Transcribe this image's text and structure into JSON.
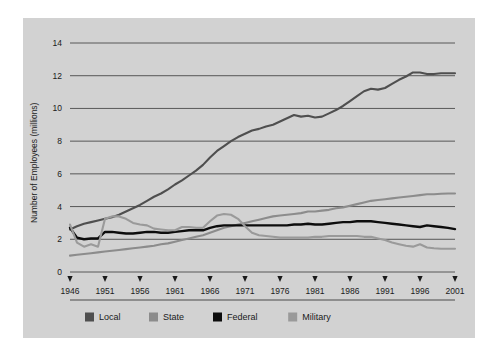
{
  "figure": {
    "background_color": "#d2d2d2",
    "page_background": "#ffffff"
  },
  "chart_data": {
    "type": "line",
    "title": "",
    "xlabel": "",
    "ylabel": "Number of Employees (millions)",
    "xlim": [
      1946,
      2001
    ],
    "ylim": [
      0,
      14
    ],
    "grid": "horizontal",
    "legend_position": "bottom",
    "xticks": [
      "1946",
      "1951",
      "1956",
      "1961",
      "1966",
      "1971",
      "1976",
      "1981",
      "1986",
      "1991",
      "1996",
      "2001"
    ],
    "yticks": [
      "0",
      "2",
      "4",
      "6",
      "8",
      "10",
      "12",
      "14"
    ],
    "x": [
      1946,
      1947,
      1948,
      1949,
      1950,
      1951,
      1952,
      1953,
      1954,
      1955,
      1956,
      1957,
      1958,
      1959,
      1960,
      1961,
      1962,
      1963,
      1964,
      1965,
      1966,
      1967,
      1968,
      1969,
      1970,
      1971,
      1972,
      1973,
      1974,
      1975,
      1976,
      1977,
      1978,
      1979,
      1980,
      1981,
      1982,
      1983,
      1984,
      1985,
      1986,
      1987,
      1988,
      1989,
      1990,
      1991,
      1992,
      1993,
      1994,
      1995,
      1996,
      1997,
      1998,
      1999,
      2000,
      2001
    ],
    "series": [
      {
        "name": "Local",
        "color": "#4f4f4f",
        "width": 2.1,
        "values": [
          2.6,
          2.8,
          2.95,
          3.05,
          3.15,
          3.25,
          3.35,
          3.5,
          3.7,
          3.9,
          4.1,
          4.35,
          4.6,
          4.8,
          5.05,
          5.35,
          5.6,
          5.9,
          6.2,
          6.55,
          7.0,
          7.4,
          7.7,
          8.0,
          8.25,
          8.45,
          8.65,
          8.75,
          8.9,
          9.0,
          9.2,
          9.4,
          9.6,
          9.5,
          9.55,
          9.45,
          9.5,
          9.7,
          9.9,
          10.15,
          10.45,
          10.75,
          11.05,
          11.2,
          11.15,
          11.25,
          11.5,
          11.75,
          11.95,
          12.2,
          12.2,
          12.1,
          12.1,
          12.15,
          12.15,
          12.15
        ]
      },
      {
        "name": "State",
        "color": "#8c8c8c",
        "width": 2.1,
        "values": [
          1.0,
          1.05,
          1.1,
          1.15,
          1.2,
          1.25,
          1.3,
          1.35,
          1.4,
          1.45,
          1.5,
          1.55,
          1.6,
          1.7,
          1.75,
          1.85,
          1.95,
          2.05,
          2.15,
          2.25,
          2.4,
          2.55,
          2.7,
          2.8,
          2.9,
          3.0,
          3.1,
          3.2,
          3.3,
          3.4,
          3.45,
          3.5,
          3.55,
          3.6,
          3.7,
          3.7,
          3.75,
          3.8,
          3.9,
          3.95,
          4.05,
          4.15,
          4.25,
          4.35,
          4.4,
          4.45,
          4.5,
          4.55,
          4.6,
          4.65,
          4.7,
          4.75,
          4.75,
          4.78,
          4.8,
          4.8
        ]
      },
      {
        "name": "Federal",
        "color": "#0d0d0d",
        "width": 2.4,
        "values": [
          2.7,
          2.1,
          2.0,
          2.05,
          2.05,
          2.45,
          2.45,
          2.4,
          2.35,
          2.35,
          2.4,
          2.45,
          2.45,
          2.4,
          2.4,
          2.45,
          2.5,
          2.55,
          2.55,
          2.55,
          2.7,
          2.8,
          2.85,
          2.85,
          2.85,
          2.85,
          2.85,
          2.85,
          2.85,
          2.85,
          2.85,
          2.85,
          2.9,
          2.9,
          2.95,
          2.9,
          2.9,
          2.95,
          3.0,
          3.05,
          3.05,
          3.1,
          3.1,
          3.1,
          3.05,
          3.0,
          2.95,
          2.9,
          2.85,
          2.8,
          2.75,
          2.85,
          2.8,
          2.75,
          2.7,
          2.62
        ]
      },
      {
        "name": "Military",
        "color": "#9a9a9a",
        "width": 2.1,
        "values": [
          2.9,
          1.8,
          1.55,
          1.7,
          1.55,
          3.25,
          3.4,
          3.4,
          3.25,
          3.0,
          2.9,
          2.85,
          2.65,
          2.6,
          2.55,
          2.55,
          2.75,
          2.75,
          2.7,
          2.7,
          3.1,
          3.45,
          3.55,
          3.5,
          3.25,
          2.8,
          2.4,
          2.25,
          2.2,
          2.15,
          2.1,
          2.1,
          2.1,
          2.1,
          2.1,
          2.15,
          2.15,
          2.2,
          2.2,
          2.2,
          2.2,
          2.2,
          2.15,
          2.15,
          2.05,
          1.95,
          1.8,
          1.7,
          1.6,
          1.55,
          1.7,
          1.5,
          1.45,
          1.42,
          1.42,
          1.42
        ]
      }
    ],
    "legend": [
      {
        "label": "Local",
        "color": "#4f4f4f"
      },
      {
        "label": "State",
        "color": "#8c8c8c"
      },
      {
        "label": "Federal",
        "color": "#0d0d0d"
      },
      {
        "label": "Military",
        "color": "#9a9a9a"
      }
    ]
  }
}
